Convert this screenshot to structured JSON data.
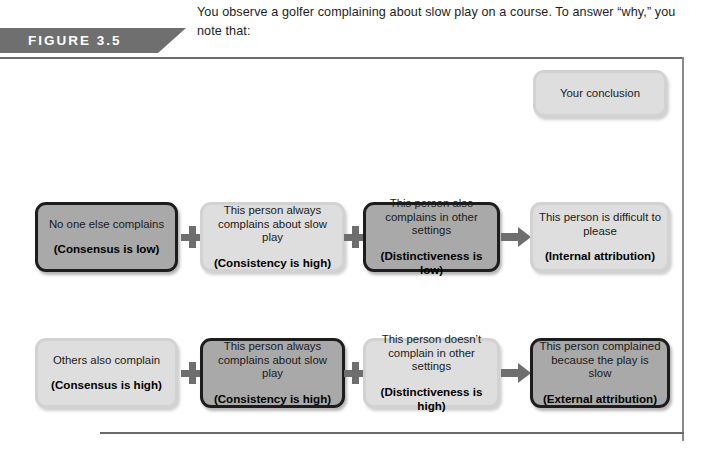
{
  "figure": {
    "tag_label": "FIGURE 3.5",
    "caption": "You observe a golfer complaining about slow play on a course. To answer “why,” you note that:"
  },
  "conclusion": {
    "label": "Your conclusion"
  },
  "symbols": {
    "plus": "+",
    "arrow": "arrow-right"
  },
  "colors": {
    "banner": "#6f6f6f",
    "node_dark_fill": "#a9a9a9",
    "node_dark_border": "#1d1d1d",
    "node_light_fill": "#dedede",
    "node_light_border": "#d2d2d2",
    "connector": "#6e6e6e",
    "rule": "#6a6a6a"
  },
  "rows": [
    {
      "id": "internal-attribution-row",
      "nodes": [
        {
          "line1": "No one else complains",
          "line2": "(Consensus is low)",
          "style": "dark"
        },
        {
          "line1": "This person always complains about slow play",
          "line2": "(Consistency is high)",
          "style": "light"
        },
        {
          "line1": "This person also complains in other settings",
          "line2": "(Distinctiveness is low)",
          "style": "dark"
        },
        {
          "line1": "This person is difficult to please",
          "line2": "(Internal attribution)",
          "style": "light"
        }
      ]
    },
    {
      "id": "external-attribution-row",
      "nodes": [
        {
          "line1": "Others also complain",
          "line2": "(Consensus is high)",
          "style": "light"
        },
        {
          "line1": "This person always complains about slow play",
          "line2": "(Consistency is high)",
          "style": "dark"
        },
        {
          "line1": "This person doesn’t complain in other settings",
          "line2": "(Distinctiveness is high)",
          "style": "light"
        },
        {
          "line1": "This person complained because the play is slow",
          "line2": "(External attribution)",
          "style": "dark"
        }
      ]
    }
  ]
}
